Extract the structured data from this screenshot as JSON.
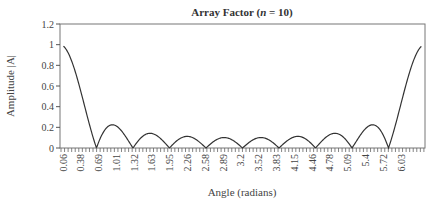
{
  "chart_data": {
    "type": "line",
    "title": "Array Factor (n = 10)",
    "title_parts": {
      "prefix": "Array Factor (",
      "var": "n",
      "suffix": " = 10)"
    },
    "xlabel": "Angle (radians)",
    "ylabel": "Amplitude |A|",
    "ylim": [
      0,
      1.2
    ],
    "xlim": [
      0.0,
      6.283
    ],
    "yticks": [
      "0",
      "0.2",
      "0.4",
      "0.6",
      "0.8",
      "1",
      "1.2"
    ],
    "ytick_values": [
      0,
      0.2,
      0.4,
      0.6,
      0.8,
      1.0,
      1.2
    ],
    "xtick_labels": [
      "0.06",
      "0.38",
      "0.69",
      "1.01",
      "1.32",
      "1.63",
      "1.95",
      "2.26",
      "2.58",
      "2.89",
      "3.2",
      "3.52",
      "3.83",
      "4.15",
      "4.46",
      "4.78",
      "5.09",
      "5.4",
      "5.72",
      "6.03"
    ],
    "grid": false,
    "legend": null,
    "series": [
      {
        "name": "|AF| n=10",
        "description": "Normalized array factor |sin(n*psi/2)/(n*sin(psi/2))|; main lobes near 0 and 2*pi, nulls at multiples of 2*pi/10, sidelobes ~0.22, 0.13, 0.10, 0.08...",
        "x": [
          0.06,
          0.38,
          0.63,
          0.69,
          0.94,
          1.01,
          1.26,
          1.32,
          1.57,
          1.63,
          1.88,
          1.95,
          2.2,
          2.26,
          2.51,
          2.58,
          2.83,
          2.89,
          3.14,
          3.2,
          3.46,
          3.52,
          3.77,
          3.83,
          4.08,
          4.15,
          4.4,
          4.46,
          4.71,
          4.78,
          5.03,
          5.09,
          5.34,
          5.4,
          5.65,
          5.72,
          5.97,
          6.03
        ],
        "y": [
          0.98,
          0.55,
          0.0,
          0.05,
          0.22,
          0.19,
          0.0,
          0.05,
          0.13,
          0.12,
          0.0,
          0.04,
          0.11,
          0.1,
          0.0,
          0.03,
          0.09,
          0.08,
          0.09,
          0.08,
          0.03,
          0.0,
          0.1,
          0.11,
          0.04,
          0.0,
          0.12,
          0.13,
          0.05,
          0.0,
          0.19,
          0.22,
          0.05,
          0.0,
          0.55,
          0.98,
          1.0,
          1.0
        ]
      }
    ],
    "n_elements": 10
  }
}
